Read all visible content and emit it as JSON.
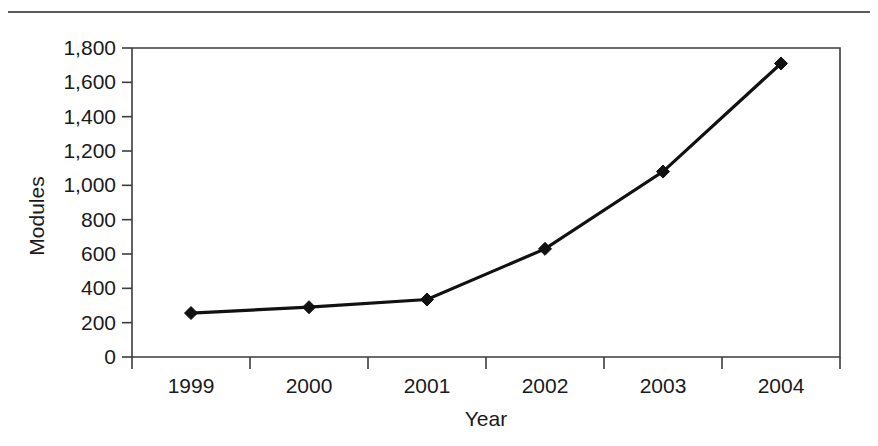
{
  "figure": {
    "rule_label": "top-rule",
    "accent_color": "#111111",
    "axis_color": "#3c3c3c",
    "rule_color": "#5b5b5b"
  },
  "chart_data": {
    "type": "line",
    "title": "",
    "subtitle": "",
    "xlabel": "Year",
    "ylabel": "Modules",
    "categories": [
      "1999",
      "2000",
      "2001",
      "2002",
      "2003",
      "2004"
    ],
    "values": [
      256,
      290,
      335,
      630,
      1080,
      1710
    ],
    "series": [
      {
        "name": "Modules",
        "values": [
          256,
          290,
          335,
          630,
          1080,
          1710
        ]
      }
    ],
    "ylim": [
      0,
      1800
    ],
    "ytick_values": [
      0,
      200,
      400,
      600,
      800,
      1000,
      1200,
      1400,
      1600,
      1800
    ],
    "ytick_labels": [
      "0",
      "200",
      "400",
      "600",
      "800",
      "1,000",
      "1,200",
      "1,400",
      "1,600",
      "1,800"
    ],
    "xtick_labels": [
      "1999",
      "2000",
      "2001",
      "2002",
      "2003",
      "2004"
    ],
    "grid": false,
    "legend": false,
    "legend_position": "none",
    "marker": "diamond",
    "line_color": "#111111"
  }
}
